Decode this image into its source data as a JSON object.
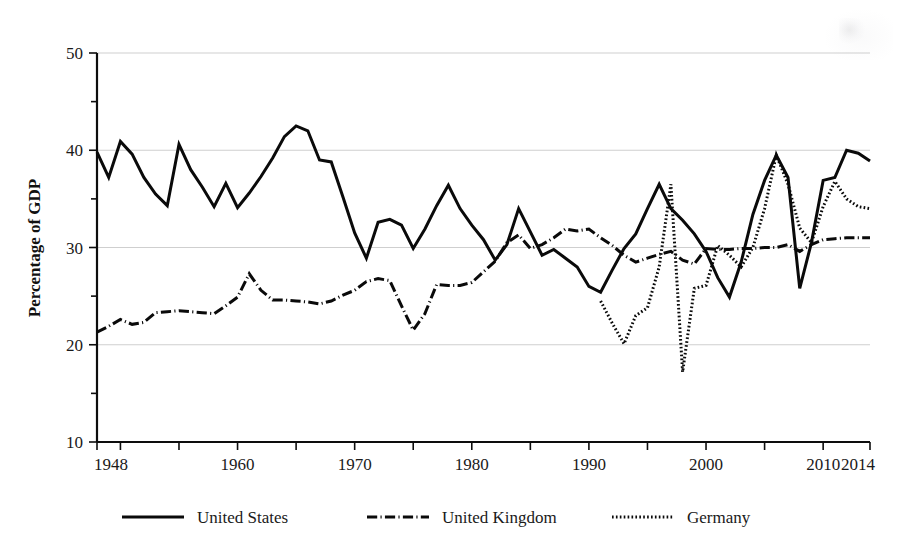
{
  "figure": {
    "background": "#ffffff",
    "ink_color": "#0a0a0a",
    "grid_color": "#cfcfcf"
  },
  "chart_data": {
    "type": "line",
    "title": "",
    "subtitle": "",
    "xlabel": "",
    "ylabel": "Percentage of GDP",
    "xlim": [
      1948,
      2014
    ],
    "ylim": [
      10,
      50
    ],
    "grid": true,
    "grid_axis": "y",
    "legend_position": "below-plot",
    "y_ticks_major": [
      10,
      20,
      30,
      40,
      50
    ],
    "y_ticks_minor": [
      15,
      25,
      35,
      45
    ],
    "y_tick_labels": [
      "10",
      "20",
      "30",
      "40",
      "50"
    ],
    "x_ticks_major": [
      1948,
      1960,
      1970,
      1980,
      1990,
      2000,
      2010,
      2014
    ],
    "x_tick_labels": [
      "1948",
      "1960",
      "1970",
      "1980",
      "1990",
      "2000",
      "2010",
      "2014"
    ],
    "x_ticks_minor": [
      1950,
      1955,
      1965,
      1975,
      1985,
      1995,
      2005
    ],
    "series": [
      {
        "name": "United States",
        "style": "solid",
        "stroke_width": 3.0,
        "color": "#0a0a0a",
        "x": [
          1948,
          1949,
          1950,
          1951,
          1952,
          1953,
          1954,
          1955,
          1956,
          1957,
          1958,
          1959,
          1960,
          1961,
          1962,
          1963,
          1964,
          1965,
          1966,
          1967,
          1968,
          1969,
          1970,
          1971,
          1972,
          1973,
          1974,
          1975,
          1976,
          1977,
          1978,
          1979,
          1980,
          1981,
          1982,
          1983,
          1984,
          1985,
          1986,
          1987,
          1988,
          1989,
          1990,
          1991,
          1992,
          1993,
          1994,
          1995,
          1996,
          1997,
          1998,
          1999,
          2000,
          2001,
          2002,
          2003,
          2004,
          2005,
          2006,
          2007,
          2008,
          2009,
          2010,
          2011,
          2012,
          2013,
          2014
        ],
        "y": [
          39.8,
          37.2,
          40.9,
          39.6,
          37.2,
          35.5,
          34.3,
          40.6,
          38.0,
          36.2,
          34.2,
          36.6,
          34.1,
          35.6,
          37.3,
          39.2,
          41.4,
          42.5,
          42.0,
          39.0,
          38.8,
          35.2,
          31.5,
          28.9,
          32.6,
          32.9,
          32.3,
          29.9,
          31.9,
          34.3,
          36.4,
          34.0,
          32.3,
          30.8,
          28.7,
          30.3,
          34.0,
          31.6,
          29.2,
          29.8,
          28.9,
          28.0,
          26.0,
          25.4,
          27.7,
          29.9,
          31.4,
          34.0,
          36.5,
          34.0,
          32.8,
          31.4,
          29.6,
          26.9,
          24.9,
          28.5,
          33.4,
          36.9,
          39.5,
          37.2,
          25.8,
          30.5,
          36.9,
          37.2,
          40.0,
          39.7,
          38.9
        ]
      },
      {
        "name": "United Kingdom",
        "style": "dashdot",
        "stroke_width": 3.0,
        "color": "#0a0a0a",
        "x": [
          1948,
          1949,
          1950,
          1951,
          1952,
          1953,
          1954,
          1955,
          1956,
          1957,
          1958,
          1959,
          1960,
          1961,
          1962,
          1963,
          1964,
          1965,
          1966,
          1967,
          1968,
          1969,
          1970,
          1971,
          1972,
          1973,
          1974,
          1975,
          1976,
          1977,
          1978,
          1979,
          1980,
          1981,
          1982,
          1983,
          1984,
          1985,
          1986,
          1987,
          1988,
          1989,
          1990,
          1991,
          1992,
          1993,
          1994,
          1995,
          1996,
          1997,
          1998,
          1999,
          2000,
          2001,
          2002,
          2003,
          2004,
          2005,
          2006,
          2007,
          2008,
          2009,
          2010,
          2011,
          2012,
          2013,
          2014
        ],
        "y": [
          21.3,
          21.9,
          22.6,
          22.1,
          22.3,
          23.3,
          23.4,
          23.5,
          23.4,
          23.3,
          23.2,
          24.0,
          24.9,
          27.3,
          25.6,
          24.6,
          24.6,
          24.5,
          24.4,
          24.2,
          24.5,
          25.1,
          25.6,
          26.5,
          26.8,
          26.6,
          24.0,
          21.5,
          23.2,
          26.2,
          26.1,
          26.1,
          26.4,
          27.5,
          28.6,
          30.5,
          31.3,
          29.9,
          30.3,
          31.0,
          31.9,
          31.7,
          31.9,
          31.0,
          30.2,
          29.2,
          28.5,
          28.9,
          29.3,
          29.6,
          28.7,
          28.3,
          29.9,
          29.8,
          29.8,
          29.9,
          29.9,
          30.0,
          30.0,
          30.3,
          29.6,
          30.3,
          30.8,
          30.9,
          31.0,
          31.0,
          31.0
        ]
      },
      {
        "name": "Germany",
        "style": "dotted",
        "stroke_width": 3.0,
        "color": "#0a0a0a",
        "x": [
          1991,
          1992,
          1993,
          1994,
          1995,
          1996,
          1997,
          1998,
          1999,
          2000,
          2001,
          2002,
          2003,
          2004,
          2005,
          2006,
          2007,
          2008,
          2009,
          2010,
          2011,
          2012,
          2013,
          2014
        ],
        "y": [
          24.5,
          22.2,
          20.1,
          23.0,
          23.8,
          28.0,
          36.5,
          17.2,
          25.8,
          26.1,
          30.2,
          29.2,
          28.0,
          30.0,
          34.0,
          39.5,
          36.5,
          32.0,
          30.5,
          34.2,
          36.8,
          35.0,
          34.2,
          34.0
        ]
      }
    ]
  },
  "legend": {
    "entries": [
      {
        "label": "United States",
        "style": "solid"
      },
      {
        "label": "United Kingdom",
        "style": "dashdot"
      },
      {
        "label": "Germany",
        "style": "dotted"
      }
    ]
  }
}
